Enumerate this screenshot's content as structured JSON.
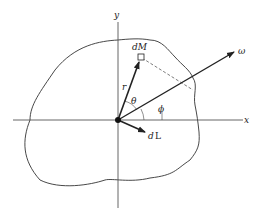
{
  "diagram": {
    "labels": {
      "x_axis": "x",
      "y_axis": "y",
      "mass_element": "dM",
      "position_vector": "r",
      "angular_velocity": "ω",
      "angular_momentum_d": "d",
      "angular_momentum_L": "L",
      "theta": "θ",
      "phi": "ϕ"
    },
    "colors": {
      "stroke": "#222222",
      "axis": "#555555",
      "background": "#ffffff"
    }
  }
}
